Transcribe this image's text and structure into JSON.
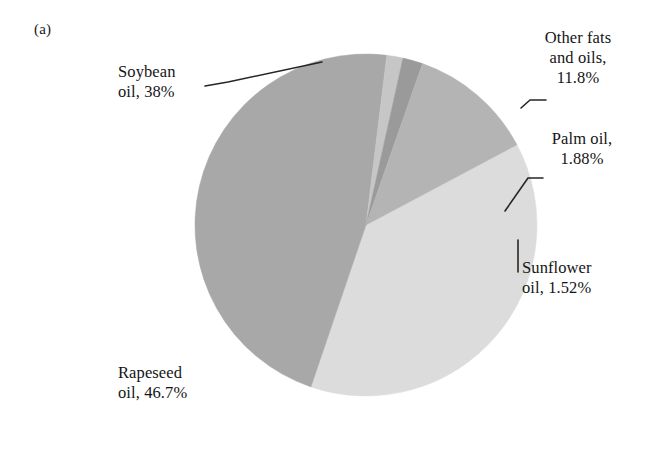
{
  "panel": {
    "label": "(a)"
  },
  "chart_data": {
    "type": "pie",
    "title": "",
    "subtitle": "",
    "xlabel": "",
    "ylabel": "",
    "legend_position": "none",
    "grid": false,
    "units": "percent",
    "center": {
      "x": 366,
      "y": 225
    },
    "radius": 171,
    "categories": [
      "Soybean oil",
      "Rapeseed oil",
      "Sunflower oil",
      "Palm oil",
      "Other fats and oils"
    ],
    "values": [
      38,
      46.7,
      1.52,
      1.88,
      11.8
    ],
    "slices": [
      {
        "name": "Soybean oil",
        "label": "Soybean\noil, 38%",
        "value": 38,
        "value_text": "38%",
        "color": "#dcdcdc",
        "start_angle": -28.0,
        "end_angle": 108.8
      },
      {
        "name": "Rapeseed oil",
        "label": "Rapeseed\noil, 46.7%",
        "value": 46.7,
        "value_text": "46.7%",
        "color": "#a8a8a8",
        "start_angle": 108.8,
        "end_angle": 277.0
      },
      {
        "name": "Sunflower oil",
        "label": "Sunflower\noil, 1.52%",
        "value": 1.52,
        "value_text": "1.52%",
        "color": "#c6c6c6",
        "start_angle": 277.0,
        "end_angle": 282.5
      },
      {
        "name": "Palm oil",
        "label": "Palm oil,\n1.88%",
        "value": 1.88,
        "value_text": "1.88%",
        "color": "#9a9a9a",
        "start_angle": 282.5,
        "end_angle": 289.3
      },
      {
        "name": "Other fats and oils",
        "label": "Other fats\nand oils,\n11.8%",
        "value": 11.8,
        "value_text": "11.8%",
        "color": "#b4b4b4",
        "start_angle": 289.3,
        "end_angle": 332.0
      }
    ]
  },
  "labels": {
    "soybean": "Soybean\noil, 38%",
    "rapeseed": "Rapeseed\noil, 46.7%",
    "sunflower": "Sunflower\noil, 1.52%",
    "palm": "Palm oil,\n1.88%",
    "otherfats": "Other fats\nand oils,\n11.8%"
  },
  "colors": {
    "background": "#ffffff",
    "text": "#151515",
    "leader_line": "#262626",
    "soybean": "#dcdcdc",
    "rapeseed": "#a8a8a8",
    "sunflower": "#c6c6c6",
    "palm": "#9a9a9a",
    "otherfats": "#b4b4b4"
  }
}
